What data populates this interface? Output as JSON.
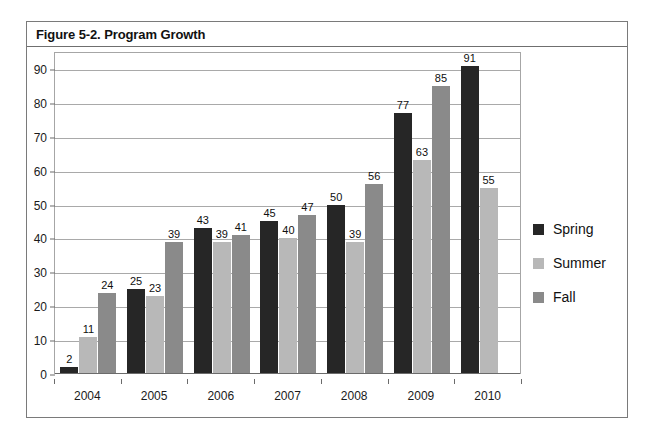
{
  "figure": {
    "title": "Figure 5-2. Program Growth"
  },
  "chart_data": {
    "type": "bar",
    "title": "Figure 5-2. Program Growth",
    "xlabel": "",
    "ylabel": "",
    "ylim": [
      0,
      95
    ],
    "yticks": [
      0,
      10,
      20,
      30,
      40,
      50,
      60,
      70,
      80,
      90
    ],
    "grid": true,
    "legend_position": "right",
    "categories": [
      "2004",
      "2005",
      "2006",
      "2007",
      "2008",
      "2009",
      "2010"
    ],
    "series": [
      {
        "name": "Spring",
        "color": "#262626",
        "values": [
          2,
          25,
          43,
          45,
          50,
          77,
          91
        ]
      },
      {
        "name": "Summer",
        "color": "#b8b8b8",
        "values": [
          11,
          23,
          39,
          40,
          39,
          63,
          55
        ]
      },
      {
        "name": "Fall",
        "color": "#8a8a8a",
        "values": [
          24,
          39,
          41,
          47,
          56,
          85,
          null
        ]
      }
    ],
    "data_labels": true
  },
  "legend": {
    "items": [
      {
        "label": "Spring",
        "color": "#262626"
      },
      {
        "label": "Summer",
        "color": "#b8b8b8"
      },
      {
        "label": "Fall",
        "color": "#8a8a8a"
      }
    ]
  }
}
